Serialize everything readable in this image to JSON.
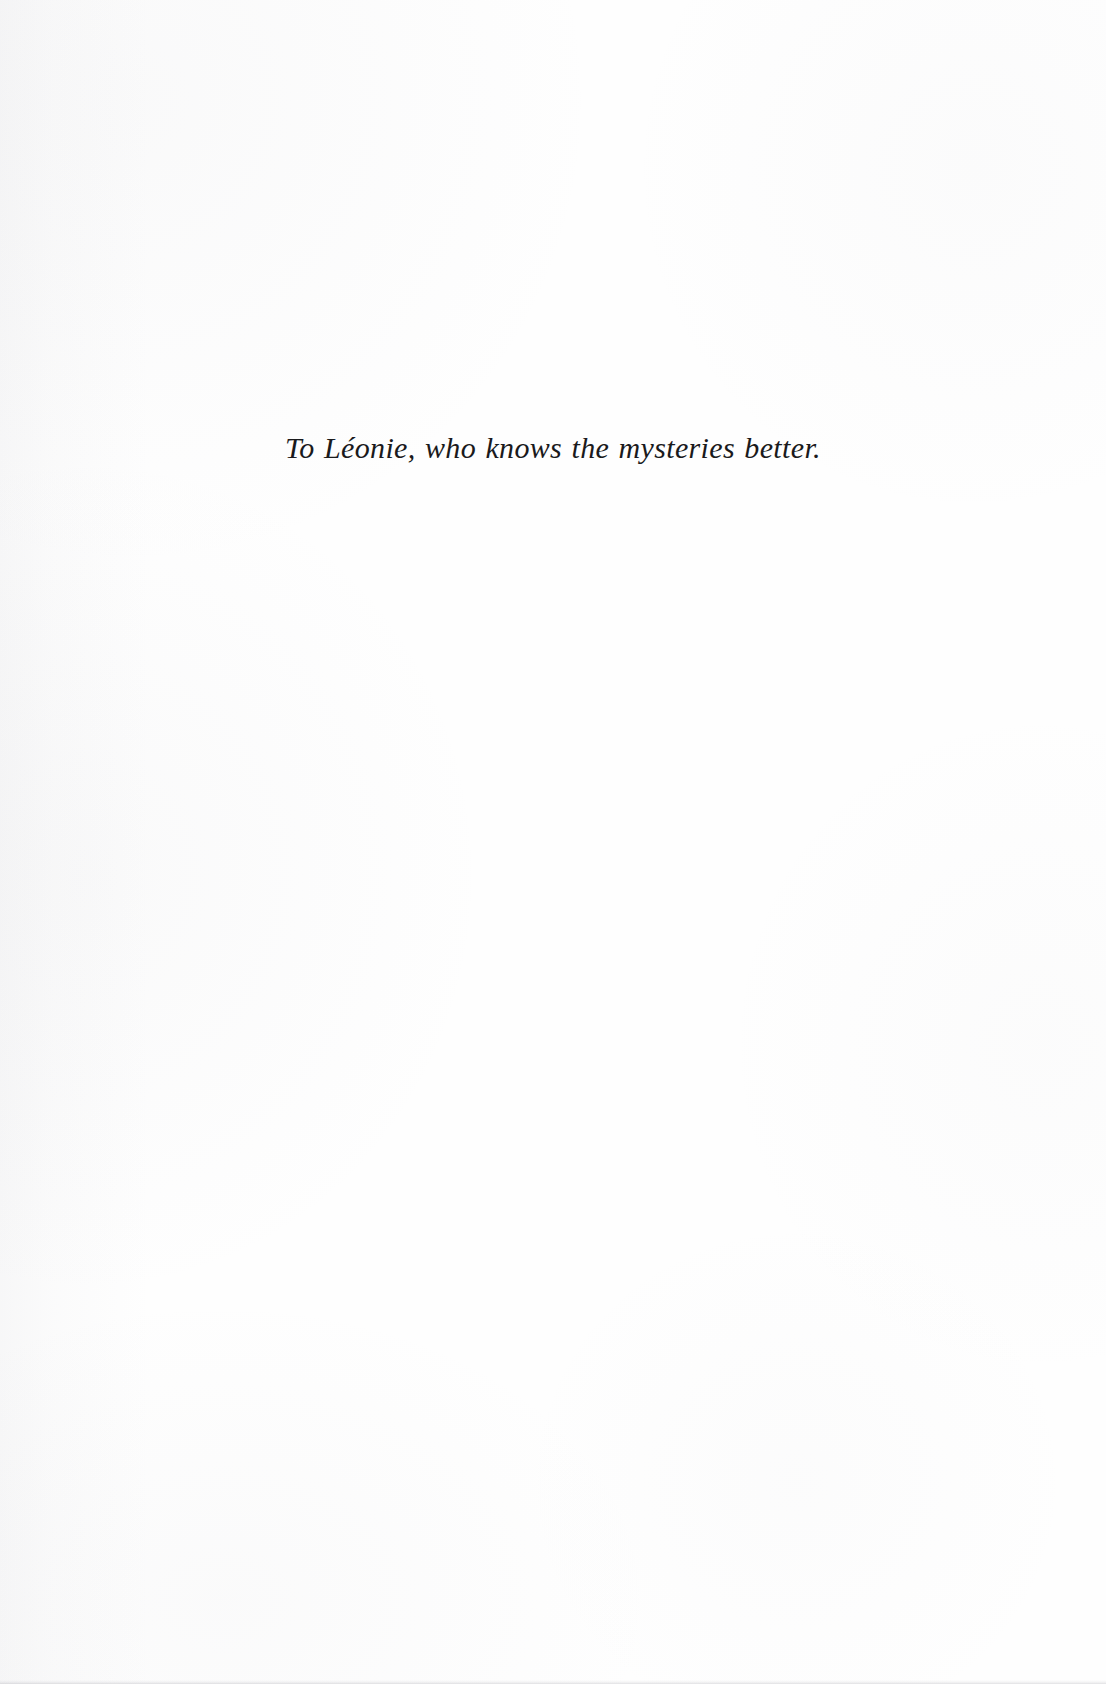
{
  "page": {
    "kind": "book-dedication-page",
    "background_color": "#fefefe",
    "ink_color": "#1a1a1c",
    "width": 1106,
    "height": 1684
  },
  "dedication": {
    "text": "To Léonie, who knows the mysteries better."
  }
}
